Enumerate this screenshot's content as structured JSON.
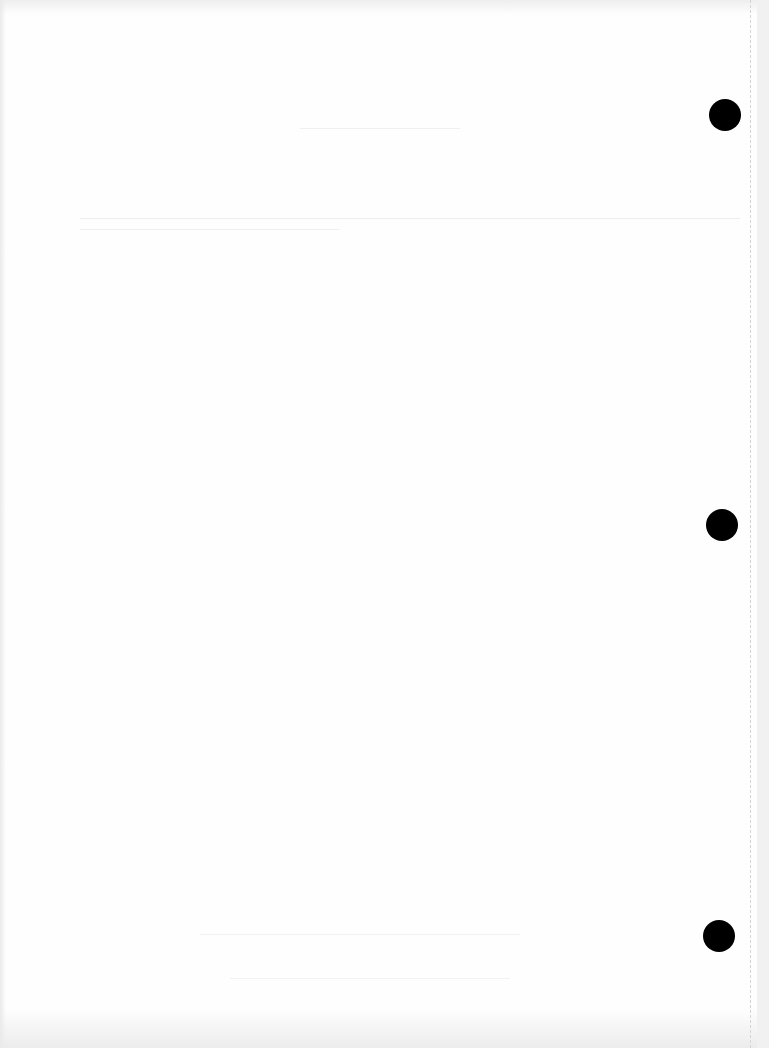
{
  "document": {
    "type": "scanned blank page",
    "ghost_text": {
      "heading": "",
      "subheading": "",
      "body_lines": []
    },
    "note": "Bleed-through text is illegible",
    "punch_holes": [
      {
        "cx": 725,
        "cy": 115
      },
      {
        "cx": 722,
        "cy": 525
      },
      {
        "cx": 719,
        "cy": 936
      }
    ],
    "colors": {
      "paper": "#fefefe",
      "hole": "#000000",
      "ghost": "#ececec",
      "margin_line": "#d4d4d4"
    }
  }
}
